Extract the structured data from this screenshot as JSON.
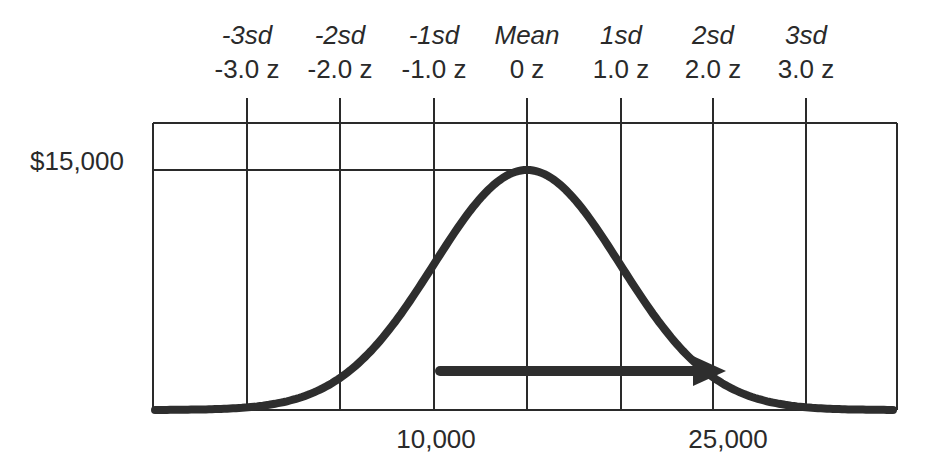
{
  "chart_data": {
    "type": "line",
    "title": "",
    "sd_labels": [
      "-3sd",
      "-2sd",
      "-1sd",
      "Mean",
      "1sd",
      "2sd",
      "3sd"
    ],
    "z_labels": [
      "-3.0 z",
      "-2.0 z",
      "-1.0 z",
      "0 z",
      "1.0 z",
      "2.0 z",
      "3.0 z"
    ],
    "z_values": [
      -3,
      -2,
      -1,
      0,
      1,
      2,
      3
    ],
    "y_label": "$15,000",
    "y_reference_value": 15000,
    "x_tick_labels": [
      {
        "label": "10,000",
        "z": -1
      },
      {
        "label": "25,000",
        "z": 2
      }
    ],
    "series": [
      {
        "name": "normal-curve",
        "shape": "gaussian",
        "mean_z": 0,
        "sd": 1,
        "peak_value": 15000
      }
    ],
    "annotations": [
      {
        "type": "arrow",
        "from_label": "10,000",
        "to_label": "25,000",
        "from_z": -1,
        "to_z": 2,
        "direction": "right"
      }
    ],
    "grid": true,
    "xlim_z": [
      -4,
      4
    ]
  },
  "colors": {
    "line": "#2a2a2a",
    "curve": "#2e2e2e",
    "background": "#ffffff"
  }
}
